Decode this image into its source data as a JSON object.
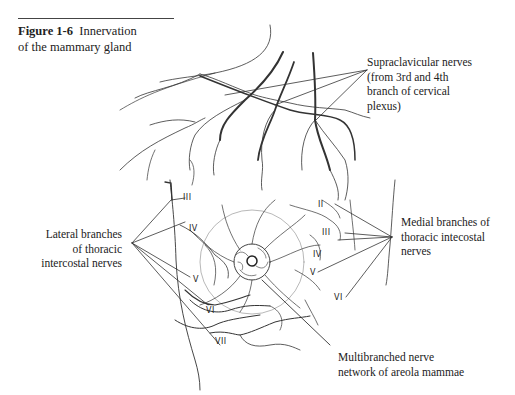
{
  "figure": {
    "number": "Figure 1-6",
    "title_line1": "Innervation",
    "title_line2": "of the mammary gland"
  },
  "labels": {
    "supraclavicular": [
      "Supraclavicular nerves",
      "(from 3rd and 4th",
      "branch of cervical",
      "plexus)"
    ],
    "lateral": [
      "Lateral branches",
      "of thoracic",
      "intercostal nerves"
    ],
    "medial": [
      "Medial branches of",
      "thoracic intecostal",
      "nerves"
    ],
    "areola": [
      "Multibranched nerve",
      "network of areola mammae"
    ]
  },
  "intercostal_numerals": {
    "lateral": [
      "III",
      "IV",
      "V",
      "VI",
      "VII"
    ],
    "medial": [
      "II",
      "III",
      "IV",
      "V",
      "VI"
    ]
  }
}
